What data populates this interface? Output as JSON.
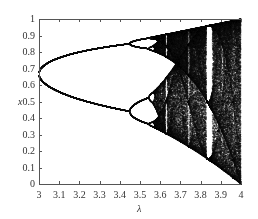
{
  "chart_data": {
    "type": "scatter",
    "title": "",
    "xlabel": "λ",
    "ylabel": "x",
    "xlim": [
      3,
      4
    ],
    "ylim": [
      0,
      1
    ],
    "grid": false,
    "legend": null,
    "xticks": [
      3,
      3.1,
      3.2,
      3.3,
      3.4,
      3.5,
      3.6,
      3.7,
      3.8,
      3.9,
      4
    ],
    "xtick_labels": [
      "3",
      "3.1",
      "3.2",
      "3.3",
      "3.4",
      "3.5",
      "3.6",
      "3.7",
      "3.8",
      "3.9",
      "4"
    ],
    "yticks": [
      0,
      0.1,
      0.2,
      0.3,
      0.4,
      0.5,
      0.6,
      0.7,
      0.8,
      0.9,
      1
    ],
    "ytick_labels": [
      "0",
      "0.1",
      "0.2",
      "0.3",
      "0.4",
      "0.5",
      "0.6",
      "0.7",
      "0.8",
      "0.9",
      "1"
    ],
    "series": [
      {
        "name": "attractor",
        "map": "logistic",
        "lambda_range": [
          3,
          4
        ],
        "features": {
          "period_2_start": 3.0,
          "period_2_values_at_3_0": [
            0.667,
            0.667
          ],
          "period_4_onset": 3.449,
          "period_8_onset": 3.544,
          "chaos_onset": 3.57,
          "period_3_window": 3.83,
          "range_at_4": [
            0,
            1
          ]
        }
      }
    ],
    "colors": {
      "points": "#111111",
      "axis": "#555555",
      "background": "#ffffff"
    }
  },
  "axes": {
    "x_title": "λ",
    "y_title": "x"
  }
}
